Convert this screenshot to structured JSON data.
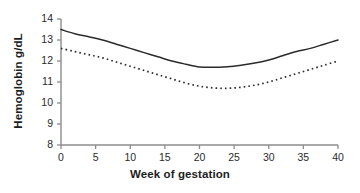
{
  "chart_data": {
    "type": "line",
    "title": "",
    "xlabel": "Week of gestation",
    "ylabel": "Hemoglobin g/dL",
    "xlim": [
      0,
      40
    ],
    "ylim": [
      8,
      14
    ],
    "xticks": [
      0,
      5,
      10,
      15,
      20,
      25,
      30,
      35,
      40
    ],
    "yticks": [
      8,
      9,
      10,
      11,
      12,
      13,
      14
    ],
    "grid": false,
    "legend": "none",
    "x": [
      0,
      2,
      4,
      6,
      8,
      10,
      12,
      14,
      16,
      18,
      20,
      22,
      24,
      26,
      28,
      30,
      32,
      34,
      36,
      38,
      40
    ],
    "series": [
      {
        "name": "solid-curve",
        "style": "solid",
        "color": "#2b2b2b",
        "values": [
          13.5,
          13.3,
          13.15,
          13.0,
          12.8,
          12.6,
          12.4,
          12.2,
          12.0,
          11.85,
          11.72,
          11.7,
          11.73,
          11.8,
          11.9,
          12.05,
          12.25,
          12.45,
          12.6,
          12.8,
          13.0
        ]
      },
      {
        "name": "dotted-curve",
        "style": "dotted",
        "color": "#2b2b2b",
        "values": [
          12.6,
          12.45,
          12.3,
          12.15,
          11.95,
          11.75,
          11.55,
          11.35,
          11.15,
          10.95,
          10.8,
          10.72,
          10.7,
          10.75,
          10.85,
          11.0,
          11.2,
          11.4,
          11.6,
          11.8,
          12.0
        ]
      }
    ],
    "axis_color": "#8c8c8c",
    "background": "#ffffff"
  },
  "axes": {
    "x_title": "Week of gestation",
    "y_title": "Hemoglobin g/dL",
    "x_tick_labels": [
      "0",
      "5",
      "10",
      "15",
      "20",
      "25",
      "30",
      "35",
      "40"
    ],
    "y_tick_labels": [
      "8",
      "9",
      "10",
      "11",
      "12",
      "13",
      "14"
    ]
  }
}
